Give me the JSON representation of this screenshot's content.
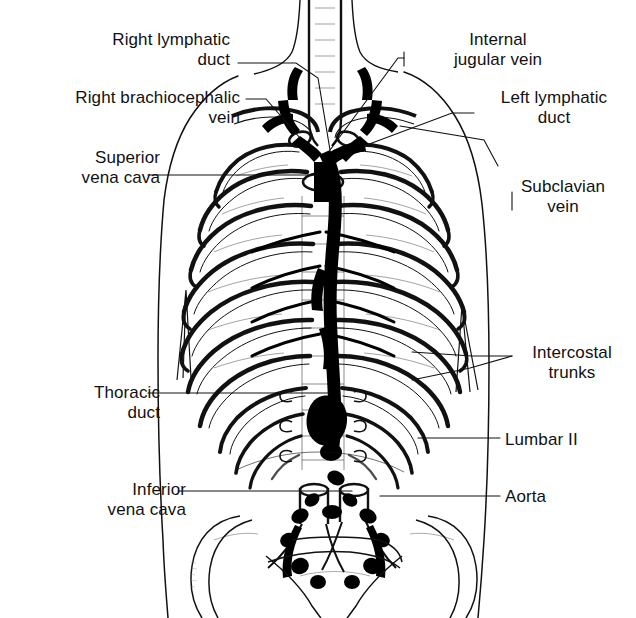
{
  "figure": {
    "style": "black-and-white anatomical line drawing",
    "background_color": "#ffffff",
    "ink_color": "#000000",
    "view": "anterior"
  },
  "labels": [
    {
      "id": "right-lymphatic-duct",
      "text": "Right lymphatic\nduct",
      "side": "left",
      "align": "right",
      "x": 230,
      "y": 30
    },
    {
      "id": "right-brachiocephalic-vein",
      "text": "Right brachiocephalic\nvein",
      "side": "left",
      "align": "right",
      "x": 240,
      "y": 88
    },
    {
      "id": "superior-vena-cava",
      "text": "Superior\nvena cava",
      "side": "left",
      "align": "right",
      "x": 160,
      "y": 148
    },
    {
      "id": "thoracic-duct",
      "text": "Thoracic\nduct",
      "side": "left",
      "align": "right",
      "x": 160,
      "y": 383
    },
    {
      "id": "inferior-vena-cava",
      "text": "Inferior\nvena cava",
      "side": "left",
      "align": "right",
      "x": 186,
      "y": 480
    },
    {
      "id": "internal-jugular-vein",
      "text": "Internal\njugular vein",
      "side": "right",
      "align": "center",
      "x": 430,
      "y": 30
    },
    {
      "id": "left-lymphatic-duct",
      "text": "Left lymphatic\nduct",
      "side": "right",
      "align": "left",
      "x": 479,
      "y": 88
    },
    {
      "id": "subclavian-vein",
      "text": "Subclavian\nvein",
      "side": "right",
      "align": "left",
      "x": 505,
      "y": 177
    },
    {
      "id": "intercostal-trunks",
      "text": "Intercostal\ntrunks",
      "side": "right",
      "align": "left",
      "x": 515,
      "y": 343
    },
    {
      "id": "lumbar-ii",
      "text": "Lumbar II",
      "side": "right",
      "align": "left",
      "x": 505,
      "y": 430
    },
    {
      "id": "aorta",
      "text": "Aorta",
      "side": "right",
      "align": "left",
      "x": 505,
      "y": 487
    }
  ],
  "structures": [
    {
      "id": "ribcage",
      "name": "rib cage",
      "count": 12
    },
    {
      "id": "vertebral-column",
      "name": "thoracic vertebral column"
    },
    {
      "id": "clavicle-left",
      "name": "left clavicle"
    },
    {
      "id": "clavicle-right",
      "name": "right clavicle"
    },
    {
      "id": "trachea",
      "name": "trachea"
    },
    {
      "id": "thoracic-duct-vessel",
      "name": "thoracic duct"
    },
    {
      "id": "cisterna-chyli",
      "name": "cisterna chyli"
    },
    {
      "id": "aorta-vessel",
      "name": "aorta"
    },
    {
      "id": "pelvis",
      "name": "pelvic girdle"
    },
    {
      "id": "body-outline",
      "name": "torso outline"
    },
    {
      "id": "lymph-nodes",
      "name": "lymph nodes"
    }
  ],
  "signature": {
    "present": true,
    "legible": false
  }
}
